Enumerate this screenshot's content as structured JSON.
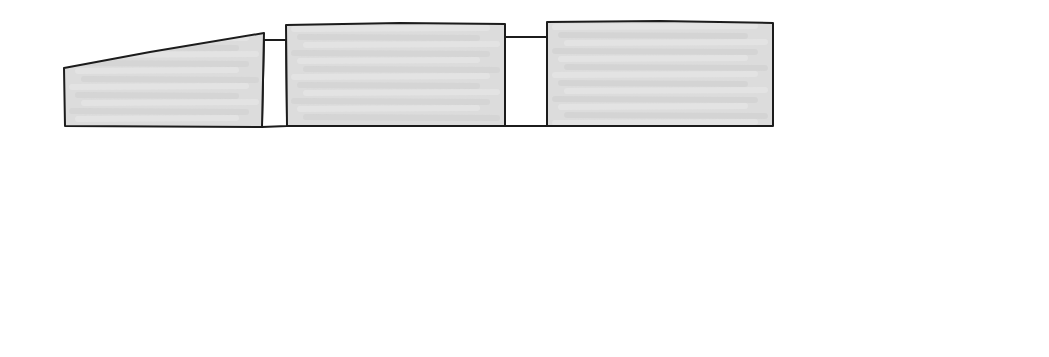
{
  "canvas": {
    "width": 1049,
    "height": 357,
    "background": "#ffffff"
  },
  "colors": {
    "outline": "#1c1c1c",
    "fill": "#dcdcdc",
    "fill_dark": "#cfcfcf",
    "fill_light": "#e9e9e9",
    "connector_fill": "#ffffff"
  },
  "diagram": {
    "kind": "hand-drawn massing sketch",
    "masses": [
      {
        "id": "mass-left-sloped",
        "shape": "sloped-roof block",
        "points": [
          [
            64,
            68
          ],
          [
            150,
            52
          ],
          [
            264,
            33
          ],
          [
            262,
            127
          ],
          [
            65,
            126
          ]
        ]
      },
      {
        "id": "mass-center",
        "shape": "rectangular block",
        "points": [
          [
            286,
            25
          ],
          [
            400,
            23
          ],
          [
            505,
            24
          ],
          [
            505,
            126
          ],
          [
            287,
            126
          ]
        ]
      },
      {
        "id": "mass-right",
        "shape": "rectangular block",
        "points": [
          [
            547,
            22
          ],
          [
            660,
            21
          ],
          [
            773,
            23
          ],
          [
            773,
            126
          ],
          [
            547,
            126
          ]
        ]
      }
    ],
    "connectors": [
      {
        "id": "link-left-center",
        "points": [
          [
            264,
            40
          ],
          [
            286,
            40
          ],
          [
            287,
            126
          ],
          [
            262,
            127
          ]
        ]
      },
      {
        "id": "link-center-right",
        "points": [
          [
            505,
            37
          ],
          [
            547,
            37
          ],
          [
            547,
            126
          ],
          [
            505,
            126
          ]
        ]
      }
    ]
  }
}
